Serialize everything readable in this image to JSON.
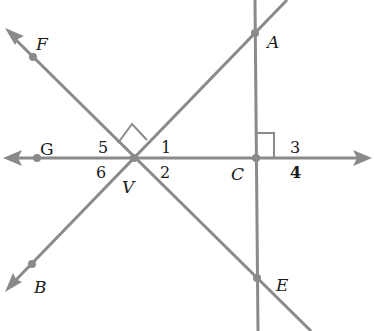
{
  "diagram": {
    "type": "geometry",
    "colors": {
      "line": "#8a8a8a",
      "text": "#1a1a1a",
      "background": "#ffffff"
    },
    "points": [
      {
        "id": "F",
        "label": "F",
        "x": 33,
        "y": 57
      },
      {
        "id": "A",
        "label": "A",
        "x": 255,
        "y": 33
      },
      {
        "id": "G",
        "label": "G",
        "x": 37,
        "y": 158
      },
      {
        "id": "V",
        "label": "V",
        "x": 134,
        "y": 158
      },
      {
        "id": "C",
        "label": "C",
        "x": 256,
        "y": 158
      },
      {
        "id": "B",
        "label": "B",
        "x": 32,
        "y": 264
      },
      {
        "id": "E",
        "label": "E",
        "x": 257,
        "y": 278
      }
    ],
    "lines": [
      {
        "id": "line-GC",
        "description": "horizontal line through G, V, C with arrows at both ends"
      },
      {
        "id": "line-CA",
        "description": "vertical line through A, C, E"
      },
      {
        "id": "line-FE",
        "description": "line through F, V, E with arrow beyond F"
      },
      {
        "id": "line-BA",
        "description": "line through B, V, A with arrow beyond B"
      }
    ],
    "right_angles": [
      {
        "at": "V",
        "between": [
          "VF",
          "VA"
        ]
      },
      {
        "at": "C",
        "between": [
          "CA",
          "C-right"
        ]
      }
    ],
    "angle_labels": {
      "a1": "1",
      "a2": "2",
      "a3": "3",
      "a4": "4",
      "a5": "5",
      "a6": "6"
    },
    "point_labels": {
      "F": "F",
      "A": "A",
      "G": "G",
      "V": "V",
      "C": "C",
      "B": "B",
      "E": "E"
    }
  }
}
